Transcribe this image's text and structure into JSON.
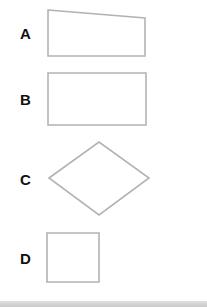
{
  "diagram": {
    "options": [
      {
        "label": "A",
        "shape": "trapezoid",
        "points": "48,10 145,18 145,56 48,56"
      },
      {
        "label": "B",
        "shape": "rectangle",
        "points": "48,73 146,73 146,125 48,125"
      },
      {
        "label": "C",
        "shape": "rhombus",
        "points": "49,178 99,142 149,178 99,215"
      },
      {
        "label": "D",
        "shape": "square",
        "points": "47,233 99,233 99,282 47,282"
      }
    ],
    "stroke_color": "#b3b3b3",
    "label_color": "#111111"
  }
}
